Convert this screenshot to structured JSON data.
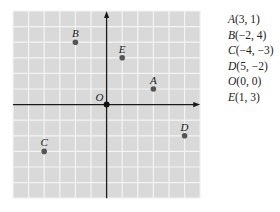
{
  "chart_data": {
    "type": "scatter",
    "title": "",
    "xlabel": "",
    "ylabel": "",
    "xlim": [
      -6,
      6
    ],
    "ylim": [
      -6,
      6
    ],
    "grid": true,
    "origin_label": "O",
    "points": [
      {
        "name": "A",
        "x": 3,
        "y": 1
      },
      {
        "name": "B",
        "x": -2,
        "y": 4
      },
      {
        "name": "C",
        "x": -4,
        "y": -3
      },
      {
        "name": "D",
        "x": 5,
        "y": -2
      },
      {
        "name": "O",
        "x": 0,
        "y": 0
      },
      {
        "name": "E",
        "x": 1,
        "y": 3
      }
    ]
  },
  "legend": {
    "items": [
      {
        "name": "A",
        "coords": "(3, 1)"
      },
      {
        "name": "B",
        "coords": "(−2, 4)"
      },
      {
        "name": "C",
        "coords": "(−4, −3)"
      },
      {
        "name": "D",
        "coords": "(5, −2)"
      },
      {
        "name": "O",
        "coords": "(0, 0)"
      },
      {
        "name": "E",
        "coords": "(1, 3)"
      }
    ]
  },
  "colors": {
    "grid_bg": "#d9d9d9",
    "grid_line": "#f4f4f4",
    "axis": "#1a1a1a",
    "point": "#555555",
    "origin_point": "#111111",
    "label": "#222222"
  }
}
